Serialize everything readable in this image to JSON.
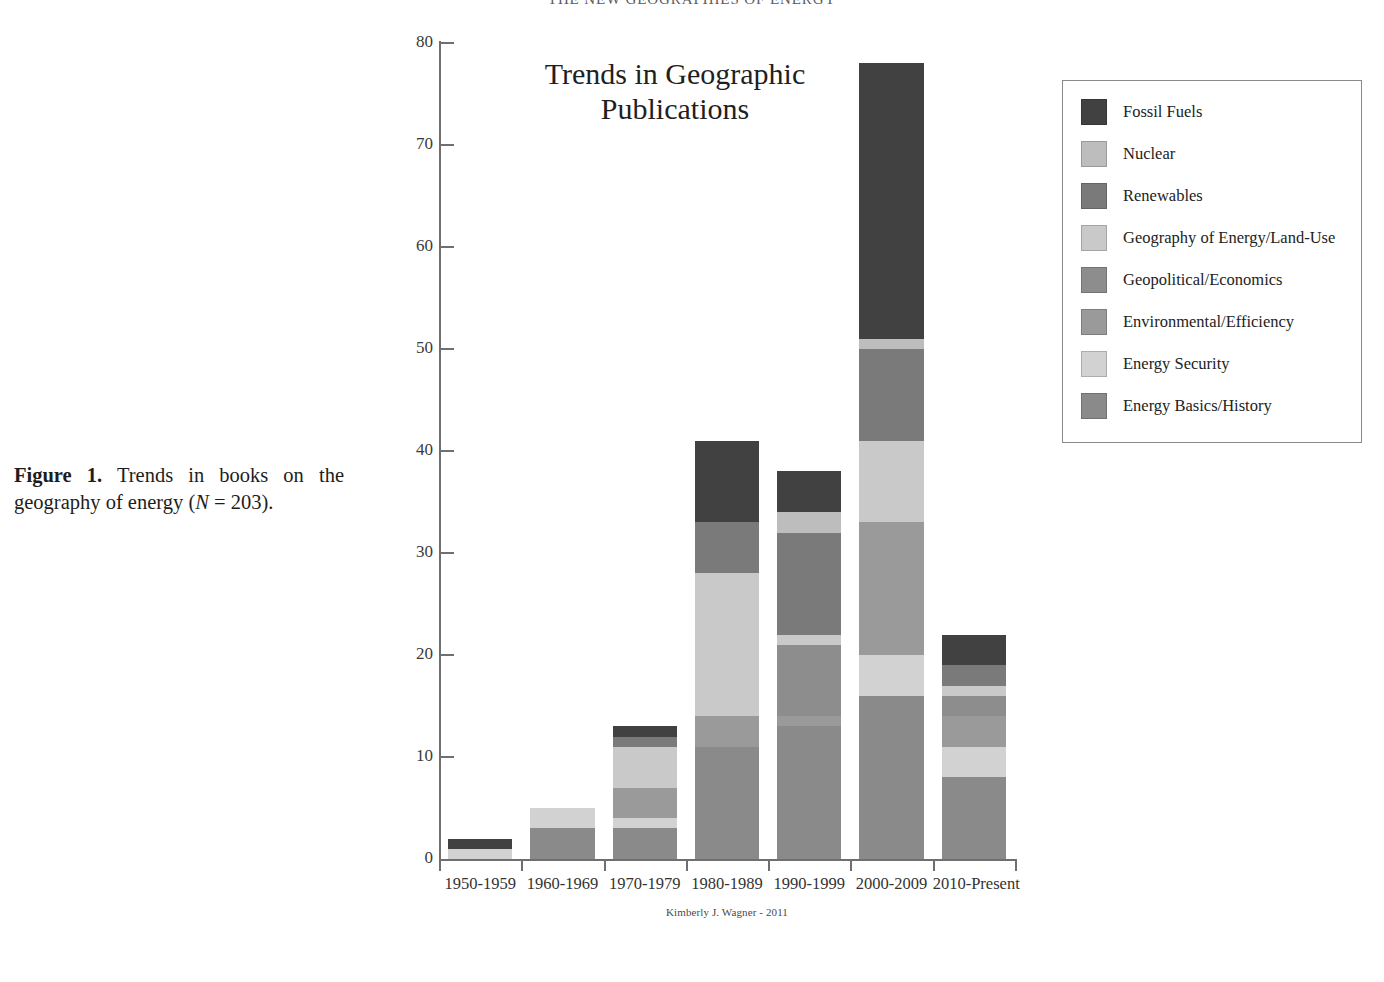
{
  "running_head": "THE NEW GEOGRAPHIES OF ENERGY",
  "caption": {
    "label": "Figure 1.",
    "text_before": "Trends in books on the geography of energy (",
    "italic_n": "N",
    "text_after": " = 203)."
  },
  "credit": "Kimberly J. Wagner - 2011",
  "legend": {
    "items": [
      {
        "label": "Fossil Fuels",
        "color": "#414141"
      },
      {
        "label": "Nuclear",
        "color": "#bdbdbd"
      },
      {
        "label": "Renewables",
        "color": "#7a7a7a"
      },
      {
        "label": "Geography of Energy/Land-Use",
        "color": "#c9c9c9"
      },
      {
        "label": "Geopolitical/Economics",
        "color": "#8d8d8d"
      },
      {
        "label": "Environmental/Efficiency",
        "color": "#9a9a9a"
      },
      {
        "label": "Energy Security",
        "color": "#d2d2d2"
      },
      {
        "label": "Energy Basics/History",
        "color": "#8a8a8a"
      }
    ]
  },
  "chart_data": {
    "type": "bar",
    "stacked": true,
    "title": "Trends in Geographic Publications",
    "xlabel": "",
    "ylabel": "",
    "ylim": [
      0,
      80
    ],
    "yticks": [
      0,
      10,
      20,
      30,
      40,
      50,
      60,
      70,
      80
    ],
    "ytick_labels": [
      "0",
      "10",
      "20",
      "30",
      "40",
      "50",
      "60",
      "70",
      "80"
    ],
    "grid": false,
    "legend_position": "right",
    "categories": [
      "1950-1959",
      "1960-1969",
      "1970-1979",
      "1980-1989",
      "1990-1999",
      "2000-2009",
      "2010-Present"
    ],
    "series": [
      {
        "name": "Energy Basics/History",
        "color": "#8a8a8a",
        "values": [
          0,
          3,
          3,
          11,
          13,
          16,
          8
        ]
      },
      {
        "name": "Energy Security",
        "color": "#d2d2d2",
        "values": [
          1,
          2,
          1,
          0,
          0,
          4,
          3
        ]
      },
      {
        "name": "Environmental/Efficiency",
        "color": "#9a9a9a",
        "values": [
          0,
          0,
          3,
          3,
          1,
          13,
          3
        ]
      },
      {
        "name": "Geopolitical/Economics",
        "color": "#8d8d8d",
        "values": [
          0,
          0,
          0,
          0,
          7,
          0,
          2
        ]
      },
      {
        "name": "Geography of Energy/Land-Use",
        "color": "#c9c9c9",
        "values": [
          0,
          0,
          4,
          14,
          1,
          8,
          1
        ]
      },
      {
        "name": "Renewables",
        "color": "#7a7a7a",
        "values": [
          0,
          0,
          1,
          5,
          10,
          9,
          2
        ]
      },
      {
        "name": "Nuclear",
        "color": "#bdbdbd",
        "values": [
          0,
          0,
          0,
          0,
          2,
          1,
          0
        ]
      },
      {
        "name": "Fossil Fuels",
        "color": "#414141",
        "values": [
          1,
          0,
          1,
          8,
          4,
          27,
          3
        ]
      }
    ],
    "totals": [
      2,
      5,
      13,
      41,
      38,
      78,
      22
    ],
    "total_n": 203
  }
}
